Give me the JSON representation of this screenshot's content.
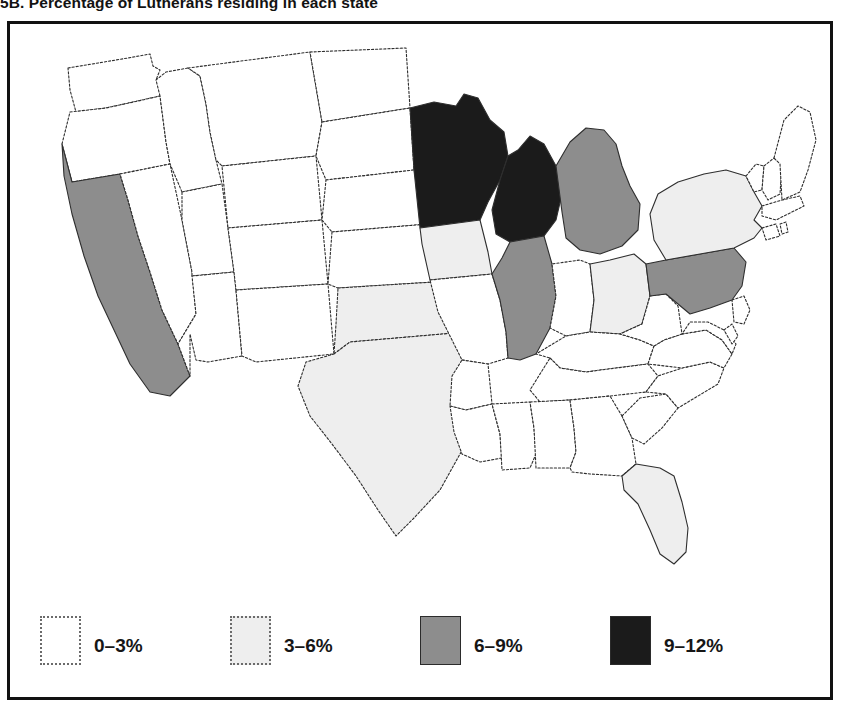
{
  "figure": {
    "caption": "5B. Percentage of Lutherans residing in each state"
  },
  "legend": {
    "title": "",
    "items": [
      {
        "label": "0–3%",
        "color": "#ffffff",
        "border": "dotted",
        "range": [
          0,
          3
        ]
      },
      {
        "label": "3–6%",
        "color": "#eeeeee",
        "border": "dotted",
        "range": [
          3,
          6
        ]
      },
      {
        "label": "6–9%",
        "color": "#8d8d8d",
        "border": "solid",
        "range": [
          6,
          9
        ]
      },
      {
        "label": "9–12%",
        "color": "#1b1b1b",
        "border": "solid",
        "range": [
          9,
          12
        ]
      }
    ]
  },
  "chart_data": {
    "type": "map",
    "title": "5B. Percentage of Lutherans residing in each state",
    "subtitle": "",
    "region": "United States (contiguous 48 states)",
    "value_label": "Percentage of Lutherans residing in each state",
    "units": "%",
    "bins": [
      "0–3%",
      "3–6%",
      "6–9%",
      "9–12%"
    ],
    "bin_colors": [
      "#ffffff",
      "#eeeeee",
      "#8d8d8d",
      "#1b1b1b"
    ],
    "legend_position": "bottom",
    "grid": false,
    "states": [
      {
        "code": "WA",
        "name": "Washington",
        "bin": "0–3%"
      },
      {
        "code": "OR",
        "name": "Oregon",
        "bin": "0–3%"
      },
      {
        "code": "CA",
        "name": "California",
        "bin": "6–9%"
      },
      {
        "code": "ID",
        "name": "Idaho",
        "bin": "0–3%"
      },
      {
        "code": "NV",
        "name": "Nevada",
        "bin": "0–3%"
      },
      {
        "code": "UT",
        "name": "Utah",
        "bin": "0–3%"
      },
      {
        "code": "AZ",
        "name": "Arizona",
        "bin": "0–3%"
      },
      {
        "code": "MT",
        "name": "Montana",
        "bin": "0–3%"
      },
      {
        "code": "WY",
        "name": "Wyoming",
        "bin": "0–3%"
      },
      {
        "code": "CO",
        "name": "Colorado",
        "bin": "0–3%"
      },
      {
        "code": "NM",
        "name": "New Mexico",
        "bin": "0–3%"
      },
      {
        "code": "ND",
        "name": "North Dakota",
        "bin": "0–3%"
      },
      {
        "code": "SD",
        "name": "South Dakota",
        "bin": "0–3%"
      },
      {
        "code": "NE",
        "name": "Nebraska",
        "bin": "0–3%"
      },
      {
        "code": "KS",
        "name": "Kansas",
        "bin": "0–3%"
      },
      {
        "code": "OK",
        "name": "Oklahoma",
        "bin": "3–6%"
      },
      {
        "code": "TX",
        "name": "Texas",
        "bin": "3–6%"
      },
      {
        "code": "MN",
        "name": "Minnesota",
        "bin": "9–12%"
      },
      {
        "code": "IA",
        "name": "Iowa",
        "bin": "3–6%"
      },
      {
        "code": "MO",
        "name": "Missouri",
        "bin": "0–3%"
      },
      {
        "code": "AR",
        "name": "Arkansas",
        "bin": "0–3%"
      },
      {
        "code": "LA",
        "name": "Louisiana",
        "bin": "0–3%"
      },
      {
        "code": "WI",
        "name": "Wisconsin",
        "bin": "9–12%"
      },
      {
        "code": "IL",
        "name": "Illinois",
        "bin": "6–9%"
      },
      {
        "code": "MI",
        "name": "Michigan",
        "bin": "6–9%"
      },
      {
        "code": "IN",
        "name": "Indiana",
        "bin": "0–3%"
      },
      {
        "code": "OH",
        "name": "Ohio",
        "bin": "3–6%"
      },
      {
        "code": "KY",
        "name": "Kentucky",
        "bin": "0–3%"
      },
      {
        "code": "TN",
        "name": "Tennessee",
        "bin": "0–3%"
      },
      {
        "code": "MS",
        "name": "Mississippi",
        "bin": "0–3%"
      },
      {
        "code": "AL",
        "name": "Alabama",
        "bin": "0–3%"
      },
      {
        "code": "GA",
        "name": "Georgia",
        "bin": "0–3%"
      },
      {
        "code": "FL",
        "name": "Florida",
        "bin": "3–6%"
      },
      {
        "code": "SC",
        "name": "South Carolina",
        "bin": "0–3%"
      },
      {
        "code": "NC",
        "name": "North Carolina",
        "bin": "0–3%"
      },
      {
        "code": "VA",
        "name": "Virginia",
        "bin": "0–3%"
      },
      {
        "code": "WV",
        "name": "West Virginia",
        "bin": "0–3%"
      },
      {
        "code": "MD",
        "name": "Maryland",
        "bin": "0–3%"
      },
      {
        "code": "DE",
        "name": "Delaware",
        "bin": "0–3%"
      },
      {
        "code": "NJ",
        "name": "New Jersey",
        "bin": "0–3%"
      },
      {
        "code": "PA",
        "name": "Pennsylvania",
        "bin": "6–9%"
      },
      {
        "code": "NY",
        "name": "New York",
        "bin": "3–6%"
      },
      {
        "code": "CT",
        "name": "Connecticut",
        "bin": "0–3%"
      },
      {
        "code": "RI",
        "name": "Rhode Island",
        "bin": "0–3%"
      },
      {
        "code": "MA",
        "name": "Massachusetts",
        "bin": "0–3%"
      },
      {
        "code": "VT",
        "name": "Vermont",
        "bin": "0–3%"
      },
      {
        "code": "NH",
        "name": "New Hampshire",
        "bin": "0–3%"
      },
      {
        "code": "ME",
        "name": "Maine",
        "bin": "0–3%"
      }
    ]
  }
}
